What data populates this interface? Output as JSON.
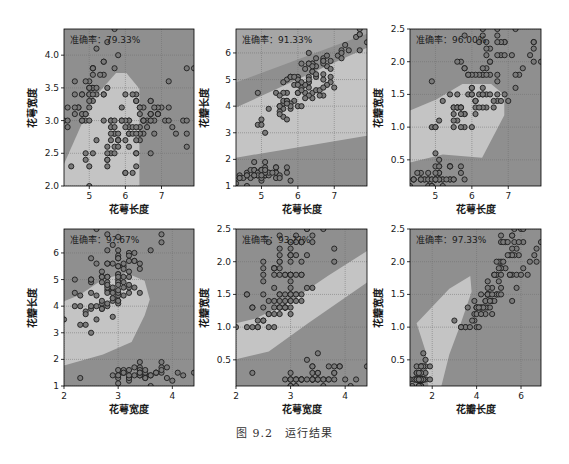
{
  "figure": {
    "caption": "图 9.2　运行结果",
    "colors": {
      "region_dark": "#8f8f8f",
      "region_mid": "#a6a6a6",
      "region_light": "#c4c4c4",
      "point_fill": "#7a7a7a",
      "point_edge": "#1e1e1e",
      "grid": "#6e6e6e",
      "axis": "#000000",
      "text": "#1a1a1a"
    }
  },
  "chart_data": [
    {
      "type": "scatter",
      "title": "",
      "annotation": "准确率：79.33%",
      "xlabel": "花萼长度",
      "ylabel": "花萼宽度",
      "xlim": [
        4.3,
        7.9
      ],
      "ylim": [
        2.0,
        4.4
      ],
      "xticks": [
        5,
        6,
        7
      ],
      "yticks": [
        2.0,
        2.5,
        3.0,
        3.5,
        4.0
      ],
      "ytick_labels": [
        "2.0",
        "2.5",
        "3.0",
        "3.5",
        "4.0"
      ],
      "grid": true,
      "decision_regions": "dark top-left & right, light center-bottom wedge"
    },
    {
      "type": "scatter",
      "title": "",
      "annotation": "准确率：91.33%",
      "xlabel": "花萼长度",
      "ylabel": "花瓣长度",
      "xlim": [
        4.3,
        7.9
      ],
      "ylim": [
        1.0,
        6.9
      ],
      "xticks": [
        5,
        6,
        7
      ],
      "yticks": [
        1,
        2,
        3,
        4,
        5,
        6
      ],
      "ytick_labels": [
        "1",
        "2",
        "3",
        "4",
        "5",
        "6"
      ],
      "grid": true,
      "decision_regions": "three diagonal bands: dark bottom, light middle, mid/dark top"
    },
    {
      "type": "scatter",
      "title": "",
      "annotation": "准确率：96.00%",
      "xlabel": "花萼长度",
      "ylabel": "花瓣宽度",
      "xlim": [
        4.3,
        7.9
      ],
      "ylim": [
        0.1,
        2.5
      ],
      "xticks": [
        5,
        6,
        7
      ],
      "yticks": [
        0.5,
        1.0,
        1.5,
        2.0,
        2.5
      ],
      "ytick_labels": [
        "0.5",
        "1.0",
        "1.5",
        "2.0",
        "2.5"
      ],
      "grid": true,
      "decision_regions": "dark bottom and top, light central blob"
    },
    {
      "type": "scatter",
      "title": "",
      "annotation": "准确率：9?.67%",
      "xlabel": "花萼宽度",
      "ylabel": "花瓣长度",
      "xlim": [
        2.0,
        4.4
      ],
      "ylim": [
        1.0,
        6.9
      ],
      "xticks": [
        2,
        3,
        4
      ],
      "yticks": [
        1,
        2,
        3,
        4,
        5,
        6
      ],
      "ytick_labels": [
        "1",
        "2",
        "3",
        "4",
        "5",
        "6"
      ],
      "grid": true,
      "decision_regions": "dark bottom band and right/top, light left-center blob"
    },
    {
      "type": "scatter",
      "title": "",
      "annotation": "准确率：93.??%",
      "xlabel": "花萼宽度",
      "ylabel": "花瓣宽度",
      "xlim": [
        2.0,
        4.4
      ],
      "ylim": [
        0.1,
        2.5
      ],
      "xticks": [
        2,
        3,
        4
      ],
      "yticks": [
        0.5,
        1.0,
        1.5,
        2.0,
        2.5
      ],
      "ytick_labels": [
        "0.5",
        "1.0",
        "1.5",
        "2.0",
        "2.5"
      ],
      "grid": true,
      "decision_regions": "dark top-left, light diagonal band, dark bottom-right"
    },
    {
      "type": "scatter",
      "title": "",
      "annotation": "准确率：97.33%",
      "xlabel": "花瓣长度",
      "ylabel": "花瓣宽度",
      "xlim": [
        1.0,
        6.9
      ],
      "ylim": [
        0.1,
        2.5
      ],
      "xticks": [
        2,
        4,
        6
      ],
      "yticks": [
        0.5,
        1.0,
        1.5,
        2.0,
        2.5
      ],
      "ytick_labels": [
        "0.5",
        "1.0",
        "1.5",
        "2.0",
        "2.5"
      ],
      "grid": true,
      "decision_regions": "dark bottom-left corner, light wedge center, dark right and top"
    }
  ],
  "points": {
    "sepal_length": [
      5.1,
      4.9,
      4.7,
      4.6,
      5.0,
      5.4,
      4.6,
      5.0,
      4.4,
      4.9,
      5.4,
      4.8,
      4.8,
      4.3,
      5.8,
      5.7,
      5.4,
      5.1,
      5.7,
      5.1,
      5.4,
      5.1,
      4.6,
      5.1,
      4.8,
      5.0,
      5.0,
      5.2,
      5.2,
      4.7,
      4.8,
      5.4,
      5.2,
      5.5,
      4.9,
      5.0,
      5.5,
      4.9,
      4.4,
      5.1,
      5.0,
      4.5,
      4.4,
      5.0,
      5.1,
      4.8,
      5.1,
      4.6,
      5.3,
      5.0,
      7.0,
      6.4,
      6.9,
      5.5,
      6.5,
      5.7,
      6.3,
      4.9,
      6.6,
      5.2,
      5.0,
      5.9,
      6.0,
      6.1,
      5.6,
      6.7,
      5.6,
      5.8,
      6.2,
      5.6,
      5.9,
      6.1,
      6.3,
      6.1,
      6.4,
      6.6,
      6.8,
      6.7,
      6.0,
      5.7,
      5.5,
      5.5,
      5.8,
      6.0,
      5.4,
      6.0,
      6.7,
      6.3,
      5.6,
      5.5,
      5.5,
      6.1,
      5.8,
      5.0,
      5.6,
      5.7,
      5.7,
      6.2,
      5.1,
      5.7,
      6.3,
      5.8,
      7.1,
      6.3,
      6.5,
      7.6,
      4.9,
      7.3,
      6.7,
      7.2,
      6.5,
      6.4,
      6.8,
      5.7,
      5.8,
      6.4,
      6.5,
      7.7,
      7.7,
      6.0,
      6.9,
      5.6,
      7.7,
      6.3,
      6.7,
      7.2,
      6.2,
      6.1,
      6.4,
      7.2,
      7.4,
      7.9,
      6.4,
      6.3,
      6.1,
      7.7,
      6.3,
      6.4,
      6.0,
      6.9,
      6.7,
      6.9,
      5.8,
      6.8,
      6.7,
      6.7,
      6.3,
      6.5,
      6.2,
      5.9
    ],
    "sepal_width": [
      3.5,
      3.0,
      3.2,
      3.1,
      3.6,
      3.9,
      3.4,
      3.4,
      2.9,
      3.1,
      3.7,
      3.4,
      3.0,
      3.0,
      4.0,
      4.4,
      3.9,
      3.5,
      3.8,
      3.8,
      3.4,
      3.7,
      3.6,
      3.3,
      3.4,
      3.0,
      3.4,
      3.5,
      3.4,
      3.2,
      3.1,
      3.4,
      4.1,
      4.2,
      3.1,
      3.2,
      3.5,
      3.6,
      3.0,
      3.4,
      3.5,
      2.3,
      3.2,
      3.5,
      3.8,
      3.0,
      3.8,
      3.2,
      3.7,
      3.3,
      3.2,
      3.2,
      3.1,
      2.3,
      2.8,
      2.8,
      3.3,
      2.4,
      2.9,
      2.7,
      2.0,
      3.0,
      2.2,
      2.9,
      2.9,
      3.1,
      3.0,
      2.7,
      2.2,
      2.5,
      3.2,
      2.8,
      2.5,
      2.8,
      2.9,
      3.0,
      2.8,
      3.0,
      2.9,
      2.6,
      2.4,
      2.4,
      2.7,
      2.7,
      3.0,
      3.4,
      3.1,
      2.3,
      3.0,
      2.5,
      2.6,
      3.0,
      2.6,
      2.3,
      2.7,
      3.0,
      2.9,
      2.9,
      2.5,
      2.8,
      3.3,
      2.7,
      3.0,
      2.9,
      3.0,
      3.0,
      2.5,
      2.9,
      2.5,
      3.6,
      3.2,
      2.7,
      3.0,
      2.5,
      2.8,
      3.2,
      3.0,
      3.8,
      2.6,
      2.2,
      3.2,
      2.8,
      2.8,
      2.7,
      3.3,
      3.2,
      2.8,
      3.0,
      2.8,
      3.0,
      2.8,
      3.8,
      2.8,
      2.8,
      2.6,
      3.0,
      3.4,
      3.1,
      3.0,
      3.1,
      3.1,
      3.1,
      2.7,
      3.2,
      3.3,
      3.0,
      2.5,
      3.0,
      3.4,
      3.0
    ],
    "petal_length": [
      1.4,
      1.4,
      1.3,
      1.5,
      1.4,
      1.7,
      1.4,
      1.5,
      1.4,
      1.5,
      1.5,
      1.6,
      1.4,
      1.1,
      1.2,
      1.5,
      1.3,
      1.4,
      1.7,
      1.5,
      1.7,
      1.5,
      1.0,
      1.7,
      1.9,
      1.6,
      1.6,
      1.5,
      1.4,
      1.6,
      1.6,
      1.5,
      1.5,
      1.4,
      1.5,
      1.2,
      1.3,
      1.4,
      1.3,
      1.5,
      1.3,
      1.3,
      1.3,
      1.6,
      1.9,
      1.4,
      1.6,
      1.4,
      1.5,
      1.4,
      4.7,
      4.5,
      4.9,
      4.0,
      4.6,
      4.5,
      4.7,
      3.3,
      4.6,
      3.9,
      3.5,
      4.2,
      4.0,
      4.7,
      3.6,
      4.4,
      4.5,
      4.1,
      4.5,
      3.9,
      4.8,
      4.0,
      4.9,
      4.7,
      4.3,
      4.4,
      4.8,
      5.0,
      4.5,
      3.5,
      3.8,
      3.7,
      3.9,
      5.1,
      4.5,
      4.5,
      4.7,
      4.4,
      4.1,
      4.0,
      4.4,
      4.6,
      4.0,
      3.3,
      4.2,
      4.2,
      4.2,
      4.3,
      3.0,
      4.1,
      6.0,
      5.1,
      5.9,
      5.6,
      5.8,
      6.6,
      4.5,
      6.3,
      5.8,
      6.1,
      5.1,
      5.3,
      5.5,
      5.0,
      5.1,
      5.3,
      5.5,
      6.7,
      6.9,
      5.0,
      5.7,
      4.9,
      6.7,
      4.9,
      5.7,
      6.0,
      4.8,
      4.9,
      5.6,
      5.8,
      6.1,
      6.4,
      5.6,
      5.1,
      5.6,
      6.1,
      5.6,
      5.5,
      4.8,
      5.4,
      5.6,
      5.1,
      5.1,
      5.9,
      5.7,
      5.2,
      5.0,
      5.2,
      5.4,
      5.1
    ],
    "petal_width": [
      0.2,
      0.2,
      0.2,
      0.2,
      0.2,
      0.4,
      0.3,
      0.2,
      0.2,
      0.1,
      0.2,
      0.2,
      0.1,
      0.1,
      0.2,
      0.4,
      0.4,
      0.3,
      0.3,
      0.3,
      0.2,
      0.4,
      0.2,
      0.5,
      0.2,
      0.2,
      0.4,
      0.2,
      0.2,
      0.2,
      0.2,
      0.4,
      0.1,
      0.2,
      0.2,
      0.2,
      0.2,
      0.1,
      0.2,
      0.2,
      0.3,
      0.3,
      0.2,
      0.6,
      0.4,
      0.3,
      0.2,
      0.2,
      0.2,
      0.2,
      1.4,
      1.5,
      1.5,
      1.3,
      1.5,
      1.3,
      1.6,
      1.0,
      1.3,
      1.4,
      1.0,
      1.5,
      1.0,
      1.4,
      1.3,
      1.4,
      1.5,
      1.0,
      1.5,
      1.1,
      1.8,
      1.3,
      1.5,
      1.2,
      1.3,
      1.4,
      1.4,
      1.7,
      1.5,
      1.0,
      1.1,
      1.0,
      1.2,
      1.6,
      1.5,
      1.6,
      1.5,
      1.3,
      1.3,
      1.3,
      1.2,
      1.4,
      1.2,
      1.0,
      1.3,
      1.2,
      1.3,
      1.3,
      1.1,
      1.3,
      2.5,
      1.9,
      2.1,
      1.8,
      2.2,
      2.1,
      1.7,
      1.8,
      1.8,
      2.5,
      2.0,
      1.9,
      2.1,
      2.0,
      2.4,
      2.3,
      1.8,
      2.2,
      2.3,
      1.5,
      2.3,
      2.0,
      2.0,
      1.8,
      2.1,
      1.8,
      1.8,
      1.8,
      2.1,
      1.6,
      1.9,
      2.0,
      2.2,
      1.5,
      1.4,
      2.3,
      2.4,
      1.8,
      1.8,
      2.1,
      2.4,
      2.3,
      1.9,
      2.3,
      2.5,
      2.3,
      1.9,
      2.0,
      2.3,
      1.8
    ]
  }
}
